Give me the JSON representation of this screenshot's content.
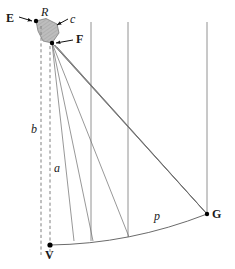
{
  "figure": {
    "type": "geometric-ray-diagram",
    "background": "#ffffff",
    "stroke_color": "#555555",
    "dash_color": "#777777",
    "shape_fill": "#b9b9b9",
    "point_color": "#000000"
  },
  "labels": {
    "E": "E",
    "R": "R",
    "c": "c",
    "F": "F",
    "b": "b",
    "a": "a",
    "p": "p",
    "G": "G",
    "V": "V"
  },
  "points": {
    "R": {
      "x": 36,
      "y": 21
    },
    "F": {
      "x": 52,
      "y": 43
    },
    "G": {
      "x": 207,
      "y": 214
    },
    "V": {
      "x": 50,
      "y": 245
    }
  },
  "label_positions": {
    "E": {
      "x": 6,
      "y": 12
    },
    "R": {
      "x": 41,
      "y": 8
    },
    "c": {
      "x": 70,
      "y": 15
    },
    "F": {
      "x": 74,
      "y": 33
    },
    "b": {
      "x": 31,
      "y": 123
    },
    "a": {
      "x": 54,
      "y": 162
    },
    "p": {
      "x": 154,
      "y": 210
    },
    "G": {
      "x": 212,
      "y": 208
    },
    "V": {
      "x": 45,
      "y": 248
    }
  },
  "elements": {
    "shaded_region": "quadrilateral RcF patch",
    "dashed_lines": [
      "b-axis vertical dashed",
      "a-axis vertical dashed"
    ],
    "vertical_lines": [
      91,
      128,
      207
    ],
    "curve": "p arc from V to G",
    "rays": "fan of rays from F converging toward G"
  }
}
